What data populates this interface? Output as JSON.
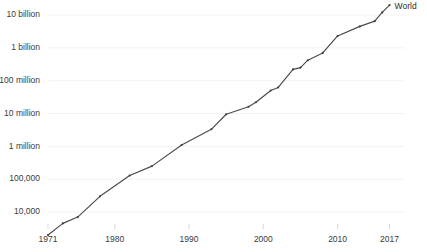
{
  "chart_data": {
    "type": "line",
    "title": "",
    "subtitle": "",
    "xlabel": "",
    "ylabel": "",
    "yscale": "log",
    "xscale": "linear",
    "grid": true,
    "legend_position": "inline-right-end",
    "xlim": [
      1971,
      2018
    ],
    "ylim": [
      2000,
      30000000000
    ],
    "xticks": [
      1971,
      1980,
      1990,
      2000,
      2010,
      2017
    ],
    "xticklabels": [
      "1971",
      "1980",
      "1990",
      "2000",
      "2010",
      "2017"
    ],
    "yticks": [
      10000,
      100000,
      1000000,
      10000000,
      100000000,
      1000000000,
      10000000000
    ],
    "yticklabels": [
      "10,000",
      "100,000",
      "1 million",
      "10 million",
      "100 million",
      "1 billion",
      "10 billion"
    ],
    "series": [
      {
        "name": "World",
        "color": "#4a4a4a",
        "annotation": "World",
        "x": [
          1971,
          1973,
          1975,
          1978,
          1982,
          1985,
          1989,
          1993,
          1995,
          1998,
          1999,
          2001,
          2002,
          2004,
          2005,
          2006,
          2008,
          2010,
          2013,
          2015,
          2016,
          2017
        ],
        "values": [
          2000,
          4500,
          7000,
          30000,
          130000,
          250000,
          1100000,
          3300000,
          9500000,
          16000000,
          22000000,
          50000000,
          62000000,
          220000000,
          250000000,
          420000000,
          700000000,
          2300000000,
          4500000000,
          6500000000,
          12000000000,
          20000000000
        ]
      }
    ]
  },
  "axis": {
    "y_tick_labels": [
      "10 billion",
      "1 billion",
      "100 million",
      "10 million",
      "1 million",
      "100,000",
      "10,000"
    ],
    "x_tick_labels": [
      "1971",
      "1980",
      "1990",
      "2000",
      "2010",
      "2017"
    ]
  },
  "annotations": {
    "series_label": "World"
  },
  "colors": {
    "line": "#4a4a4a",
    "grid": "#f0f0f0",
    "text": "#3a3a3a",
    "background": "#ffffff"
  }
}
